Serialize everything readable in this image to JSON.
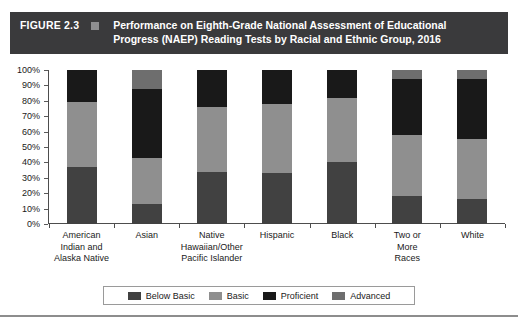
{
  "figure": {
    "number_label": "FIGURE 2.3",
    "title": "Performance on Eighth-Grade National Assessment of Educational Progress (NAEP) Reading Tests by Racial and Ethnic Group, 2016",
    "header_bg": "#3a3a3c",
    "header_square_color": "#8e8e90"
  },
  "chart_data": {
    "type": "bar",
    "stacked": true,
    "stack_mode": "percent",
    "title": "Performance on Eighth-Grade National Assessment of Educational Progress (NAEP) Reading Tests by Racial and Ethnic Group, 2016",
    "xlabel": "",
    "ylabel": "",
    "ylim": [
      0,
      100
    ],
    "grid": false,
    "legend_position": "bottom",
    "ytick_labels": [
      "0%",
      "10%",
      "20%",
      "30%",
      "40%",
      "50%",
      "60%",
      "70%",
      "80%",
      "90%",
      "100%"
    ],
    "ytick_values": [
      0,
      10,
      20,
      30,
      40,
      50,
      60,
      70,
      80,
      90,
      100
    ],
    "categories": [
      "American Indian and Alaska Native",
      "Asian",
      "Native Hawaiian/Other Pacific Islander",
      "Hispanic",
      "Black",
      "Two or More Races",
      "White"
    ],
    "category_lines": [
      [
        "American",
        "Indian and",
        "Alaska Native"
      ],
      [
        "Asian"
      ],
      [
        "Native",
        "Hawaiian/Other",
        "Pacific Islander"
      ],
      [
        "Hispanic"
      ],
      [
        "Black"
      ],
      [
        "Two or",
        "More",
        "Races"
      ],
      [
        "White"
      ]
    ],
    "series": [
      {
        "name": "Below Basic",
        "color": "#414141",
        "values": [
          37,
          13,
          34,
          33,
          40,
          18,
          16
        ]
      },
      {
        "name": "Basic",
        "color": "#8f8f8f",
        "values": [
          42,
          30,
          42,
          45,
          42,
          40,
          39
        ]
      },
      {
        "name": "Proficient",
        "color": "#191919",
        "values": [
          21,
          45,
          24,
          22,
          18,
          36,
          39
        ]
      },
      {
        "name": "Advanced",
        "color": "#6e6e6e",
        "values": [
          0,
          12,
          0,
          0,
          0,
          6,
          6
        ]
      }
    ]
  },
  "legend": {
    "items": [
      {
        "label": "Below Basic",
        "color": "#414141"
      },
      {
        "label": "Basic",
        "color": "#8f8f8f"
      },
      {
        "label": "Proficient",
        "color": "#191919"
      },
      {
        "label": "Advanced",
        "color": "#6e6e6e"
      }
    ]
  }
}
